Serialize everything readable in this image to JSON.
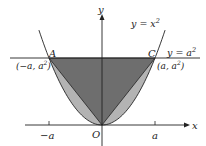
{
  "diagram": {
    "axes": {
      "x_label": "x",
      "y_label": "y",
      "origin_label": "O"
    },
    "ticks": {
      "neg_a": "−a",
      "pos_a": "a"
    },
    "curves": {
      "parabola_label_base": "y = x",
      "parabola_label_exp": "2",
      "line_label_base": "y = a",
      "line_label_exp": "2"
    },
    "points": {
      "A": {
        "name": "A",
        "coord_base": "(−a, a",
        "coord_exp": "2",
        "coord_close": ")"
      },
      "C": {
        "name": "C",
        "coord_base": "(a, a",
        "coord_exp": "2",
        "coord_close": ")"
      }
    },
    "colors": {
      "triangle_fill": "#6e6e6e",
      "parabola_region_fill": "#b3b3b3",
      "stroke": "#222222"
    }
  }
}
